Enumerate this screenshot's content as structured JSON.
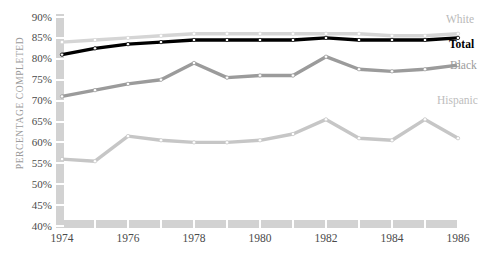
{
  "chart_data": {
    "type": "line",
    "title": "",
    "xlabel": "",
    "ylabel": "PERCENTAGE COMPLETED",
    "x": [
      1974,
      1975,
      1976,
      1977,
      1978,
      1979,
      1980,
      1981,
      1982,
      1983,
      1984,
      1985,
      1986
    ],
    "xtick_labels": [
      "1974",
      "1976",
      "1978",
      "1980",
      "1982",
      "1984",
      "1986"
    ],
    "xtick_values": [
      1974,
      1976,
      1978,
      1980,
      1982,
      1984,
      1986
    ],
    "xlim": [
      1974,
      1986
    ],
    "ytick_labels": [
      "90%",
      "85%",
      "80%",
      "75%",
      "70%",
      "65%",
      "60%",
      "55%",
      "50%",
      "45%",
      "40%"
    ],
    "ytick_values": [
      90,
      85,
      80,
      75,
      70,
      65,
      60,
      55,
      50,
      45,
      40
    ],
    "ylim": [
      40,
      90
    ],
    "grid": false,
    "legend_position": "right-inline-labels",
    "series": [
      {
        "name": "White",
        "color": "#d5d5d5",
        "label": "White",
        "label_color": "#b9b9b9",
        "values": [
          84.0,
          84.5,
          85.0,
          85.5,
          86.0,
          86.0,
          86.0,
          86.0,
          86.0,
          86.0,
          85.5,
          85.5,
          86.0
        ]
      },
      {
        "name": "Total",
        "color": "#000000",
        "label": "Total",
        "label_color": "#000000",
        "values": [
          81.0,
          82.5,
          83.5,
          84.0,
          84.5,
          84.5,
          84.5,
          84.5,
          85.0,
          84.5,
          84.5,
          84.5,
          85.0
        ]
      },
      {
        "name": "Black",
        "color": "#9b9b9b",
        "label": "Black",
        "label_color": "#9b9b9b",
        "values": [
          71.0,
          72.5,
          74.0,
          75.0,
          79.0,
          75.5,
          76.0,
          76.0,
          80.5,
          77.5,
          77.0,
          77.5,
          78.5
        ]
      },
      {
        "name": "Hispanic",
        "color": "#c6c6c6",
        "label": "Hispanic",
        "label_color": "#bdbdbd",
        "values": [
          56.0,
          55.5,
          61.5,
          60.5,
          60.0,
          60.0,
          60.5,
          62.0,
          65.5,
          61.0,
          60.5,
          65.5,
          61.0
        ]
      }
    ],
    "marker": "circle-open-white",
    "axis_color": "#d2d2d2",
    "tick_label_color": "#4a4a4a",
    "axis_title_color": "#9a9a9a",
    "background": "#ffffff"
  }
}
